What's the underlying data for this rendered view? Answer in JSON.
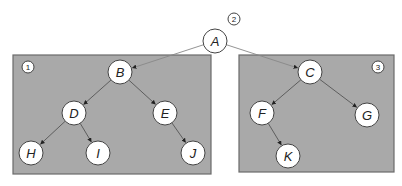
{
  "diagram": {
    "type": "binary-tree-partition",
    "colors": {
      "box_fill": "#a9a9a9",
      "box_stroke": "#6b6b6b",
      "node_fill": "#ffffff",
      "node_stroke": "#444444",
      "edge": "#555555"
    },
    "regions": [
      {
        "id": "region-1",
        "badge": "1",
        "x": 13,
        "y": 55,
        "w": 198,
        "h": 119,
        "badge_x": 28,
        "badge_y": 67
      },
      {
        "id": "region-3",
        "badge": "3",
        "x": 239,
        "y": 55,
        "w": 155,
        "h": 117,
        "badge_x": 378,
        "badge_y": 67
      }
    ],
    "root_badge": {
      "label": "2",
      "x": 234,
      "y": 19
    },
    "nodes": [
      {
        "id": "A",
        "label": "A",
        "x": 215,
        "y": 41
      },
      {
        "id": "B",
        "label": "B",
        "x": 120,
        "y": 72
      },
      {
        "id": "C",
        "label": "C",
        "x": 310,
        "y": 72
      },
      {
        "id": "D",
        "label": "D",
        "x": 74,
        "y": 113
      },
      {
        "id": "E",
        "label": "E",
        "x": 165,
        "y": 113
      },
      {
        "id": "F",
        "label": "F",
        "x": 262,
        "y": 113
      },
      {
        "id": "G",
        "label": "G",
        "x": 367,
        "y": 115
      },
      {
        "id": "H",
        "label": "H",
        "x": 31,
        "y": 153
      },
      {
        "id": "I",
        "label": "I",
        "x": 98,
        "y": 153
      },
      {
        "id": "J",
        "label": "J",
        "x": 193,
        "y": 153
      },
      {
        "id": "K",
        "label": "K",
        "x": 288,
        "y": 156
      }
    ],
    "edges": [
      {
        "from": "A",
        "to": "B"
      },
      {
        "from": "A",
        "to": "C"
      },
      {
        "from": "B",
        "to": "D"
      },
      {
        "from": "B",
        "to": "E"
      },
      {
        "from": "D",
        "to": "H"
      },
      {
        "from": "D",
        "to": "I"
      },
      {
        "from": "E",
        "to": "J"
      },
      {
        "from": "C",
        "to": "F"
      },
      {
        "from": "C",
        "to": "G"
      },
      {
        "from": "F",
        "to": "K"
      }
    ]
  }
}
